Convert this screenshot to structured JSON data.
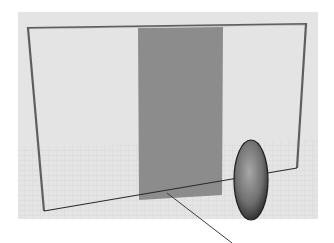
{
  "viewport": {
    "name": "3D perspective viewport",
    "background_color": "#e4e4e4",
    "grid_color": "#d2d2d2"
  },
  "scene": {
    "objects": [
      {
        "type": "wire-frame",
        "label": "rectangular frame",
        "color": "#5a5a5a"
      },
      {
        "type": "plane",
        "label": "gray panel",
        "color": "#8c8c8c"
      },
      {
        "type": "ellipsoid",
        "label": "shaded ellipsoid",
        "color": "#7a7a7a"
      }
    ],
    "axes": [
      {
        "label": "ground axis horizontal",
        "color": "#2a2a2a"
      },
      {
        "label": "ground axis depth",
        "color": "#3a3a3a"
      }
    ]
  }
}
